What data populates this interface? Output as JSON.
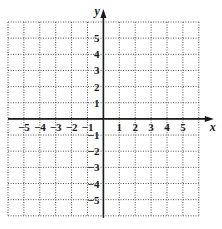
{
  "chart_data": {
    "type": "coordinate-grid",
    "title": "",
    "xlabel": "x",
    "ylabel": "y",
    "xlim": [
      -6,
      6
    ],
    "ylim": [
      -6,
      6
    ],
    "grid": true,
    "grid_style": "dotted",
    "x_ticks": [
      -5,
      -4,
      -3,
      -2,
      -1,
      1,
      2,
      3,
      4,
      5
    ],
    "y_ticks": [
      5,
      4,
      3,
      2,
      1,
      -1,
      -2,
      -3,
      -4,
      -5
    ],
    "x_tick_labels": [
      "−5",
      "−4",
      "−3",
      "−2",
      "−1",
      "1",
      "2",
      "3",
      "4",
      "5"
    ],
    "y_tick_labels": [
      "5",
      "4",
      "3",
      "2",
      "1",
      "−1",
      "−2",
      "−3",
      "−4",
      "−5"
    ],
    "points": []
  },
  "layout": {
    "grid_left": 8,
    "grid_top": 22,
    "cell_w": 15.9,
    "cell_h": 16.15,
    "cols": 12,
    "rows": 12,
    "axis_color": "#1a1a1a",
    "grid_color": "#555555"
  }
}
